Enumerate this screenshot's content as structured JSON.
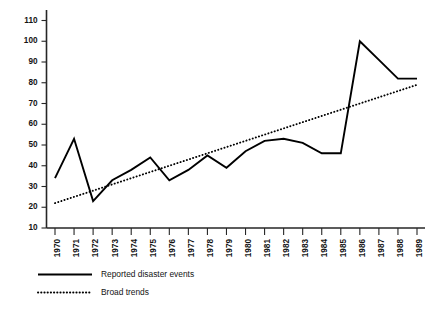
{
  "chart_data": {
    "type": "line",
    "title": "",
    "subtitle": "",
    "xlabel": "",
    "ylabel": "",
    "categories": [
      "1970",
      "1971",
      "1972",
      "1973",
      "1974",
      "1975",
      "1976",
      "1977",
      "1978",
      "1979",
      "1980",
      "1981",
      "1982",
      "1983",
      "1984",
      "1985",
      "1986",
      "1987",
      "1988",
      "1989"
    ],
    "series": [
      {
        "name": "Reported disaster events",
        "style": "solid",
        "color": "#000000",
        "values": [
          34,
          53,
          23,
          33,
          38,
          44,
          33,
          38,
          45,
          39,
          47,
          52,
          53,
          51,
          46,
          46,
          100,
          91,
          82,
          82
        ]
      },
      {
        "name": "Broad trends",
        "style": "dotted",
        "color": "#000000",
        "values": [
          22,
          25,
          28,
          31,
          34,
          37,
          40,
          43,
          46,
          49,
          52,
          55,
          58,
          61,
          64,
          67,
          70,
          73,
          76,
          79
        ]
      }
    ],
    "ylim": [
      10,
      110
    ],
    "yticks": [
      10,
      20,
      30,
      40,
      50,
      60,
      70,
      80,
      90,
      100,
      110
    ],
    "ytick_labels": [
      "10",
      "20",
      "30",
      "40",
      "50",
      "60",
      "70",
      "80",
      "90",
      "100",
      "110"
    ],
    "grid": false,
    "legend_position": "bottom-left",
    "legend": [
      {
        "label": "Reported disaster events",
        "style": "solid"
      },
      {
        "label": "Broad trends",
        "style": "dotted"
      }
    ]
  }
}
